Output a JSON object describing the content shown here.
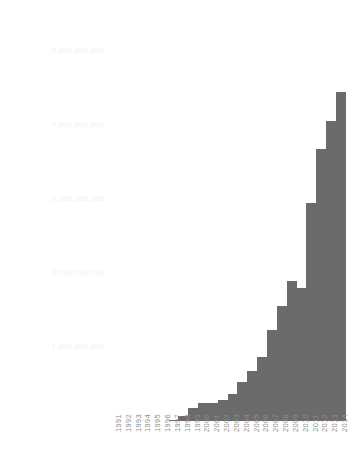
{
  "chart_data": {
    "type": "bar",
    "title": "",
    "subtitle": "",
    "xlabel": "",
    "ylabel": "",
    "categories": [
      "1991",
      "1992",
      "1993",
      "1994",
      "1995",
      "1996",
      "1997",
      "1998",
      "1999",
      "2000",
      "2001",
      "2002",
      "2003",
      "2004",
      "2005",
      "2006",
      "2007",
      "2008",
      "2009",
      "2010",
      "2011",
      "2012",
      "2013",
      "2014"
    ],
    "values": [
      0,
      0,
      0,
      0,
      0,
      0,
      20000000,
      70000000,
      180000000,
      250000000,
      250000000,
      290000000,
      370000000,
      530000000,
      670000000,
      870000000,
      1230000000,
      1560000000,
      1890000000,
      1800000000,
      2940000000,
      3680000000,
      4060000000,
      4450000000
    ],
    "ylim": [
      0,
      5000000000
    ],
    "yticks": [
      1000000000,
      2000000000,
      3000000000,
      4000000000,
      5000000000
    ],
    "ytick_labels": [
      "1,000,000,000",
      "2,000,000,000",
      "3,000,000,000",
      "4,000,000,000",
      "5,000,000,000"
    ],
    "grid": false,
    "legend": "none",
    "series": [
      {
        "name": "",
        "color": "#6b6b6b",
        "values": [
          0,
          0,
          0,
          0,
          0,
          0,
          20000000,
          70000000,
          180000000,
          250000000,
          250000000,
          290000000,
          370000000,
          530000000,
          670000000,
          870000000,
          1230000000,
          1560000000,
          1890000000,
          1800000000,
          2940000000,
          3680000000,
          4060000000,
          4450000000
        ]
      }
    ]
  },
  "colors": {
    "bar": "#6b6b6b",
    "background": "#ffffff",
    "y_tick_text": "#f1f1f1",
    "x_tick_text": "#8e8e8e"
  }
}
